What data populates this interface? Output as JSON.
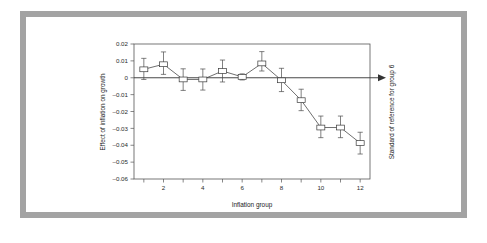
{
  "figure": {
    "frame_color": "#a3a3a3",
    "background_color": "#ffffff"
  },
  "chart_data": {
    "type": "line",
    "title": "",
    "subtitle": "",
    "xlabel": "Inflation group",
    "ylabel": "Effect of inflation on growth",
    "annotation": "Standard of reference for group 6",
    "grid": false,
    "legend": "none",
    "xlim": [
      0.5,
      12.5
    ],
    "ylim": [
      -0.06,
      0.02
    ],
    "yticks": [
      0.02,
      0.01,
      0,
      -0.01,
      -0.02,
      -0.03,
      -0.04,
      -0.05,
      -0.06
    ],
    "ytick_labels": [
      "0.02",
      "0.01",
      "0",
      "–0.01",
      "–0.02",
      "–0.03",
      "–0.04",
      "–0.05",
      "–0.06"
    ],
    "xticks": [
      1,
      2,
      3,
      4,
      5,
      6,
      7,
      8,
      9,
      10,
      11,
      12
    ],
    "xtick_labels": [
      "",
      "2",
      "",
      "4",
      "",
      "6",
      "",
      "8",
      "",
      "10",
      "",
      "12"
    ],
    "x": [
      1,
      2,
      3,
      4,
      5,
      6,
      7,
      8,
      9,
      10,
      11,
      12
    ],
    "values": [
      0.005,
      0.008,
      -0.001,
      -0.001,
      0.004,
      0.0005,
      0.0085,
      -0.0015,
      -0.0133,
      -0.0295,
      -0.0295,
      -0.0387
    ],
    "err_low": [
      -0.001,
      0.002,
      -0.0075,
      -0.0073,
      -0.0025,
      -0.0013,
      0.004,
      -0.0082,
      -0.0195,
      -0.0355,
      -0.0355,
      -0.0452
    ],
    "err_high": [
      0.0115,
      0.0153,
      0.0053,
      0.0052,
      0.0105,
      0.0023,
      0.0155,
      0.0056,
      -0.0068,
      -0.0227,
      -0.0227,
      -0.0323
    ],
    "reference_group": 6,
    "zero_reference_line": 0
  }
}
